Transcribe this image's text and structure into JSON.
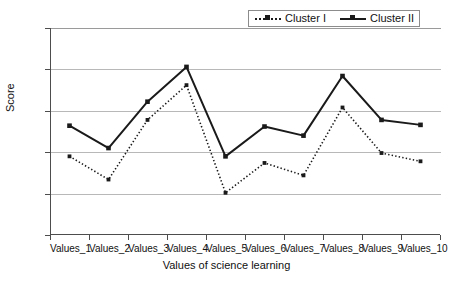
{
  "chart_data": {
    "type": "line",
    "title": "",
    "xlabel": "Values of science learning",
    "ylabel": "Score",
    "categories": [
      "Values_1",
      "Values_2",
      "Values_3",
      "Values_4",
      "Values_5",
      "Values_6",
      "Values_7",
      "Values_8",
      "Values_9",
      "Values_10"
    ],
    "series": [
      {
        "name": "Cluster I",
        "style": "dotted",
        "marker": "square",
        "color": "#1a1a1a",
        "values": [
          1.95,
          1.67,
          2.39,
          2.81,
          1.51,
          1.87,
          1.72,
          2.54,
          1.99,
          1.89
        ]
      },
      {
        "name": "Cluster II",
        "style": "solid",
        "marker": "square",
        "color": "#1a1a1a",
        "values": [
          2.32,
          2.05,
          2.61,
          3.03,
          1.95,
          2.31,
          2.2,
          2.92,
          2.39,
          2.33
        ]
      }
    ],
    "ylim": [
      1,
      3.5
    ],
    "yticks": [
      "1",
      "1.5",
      "2",
      "2.5",
      "3",
      "3.5"
    ],
    "ytick_values": [
      1,
      1.5,
      2,
      2.5,
      3,
      3.5
    ],
    "grid": "horizontal",
    "legend_position": "top-right"
  },
  "legend": {
    "entries": [
      {
        "label": "Cluster I"
      },
      {
        "label": "Cluster II"
      }
    ]
  }
}
